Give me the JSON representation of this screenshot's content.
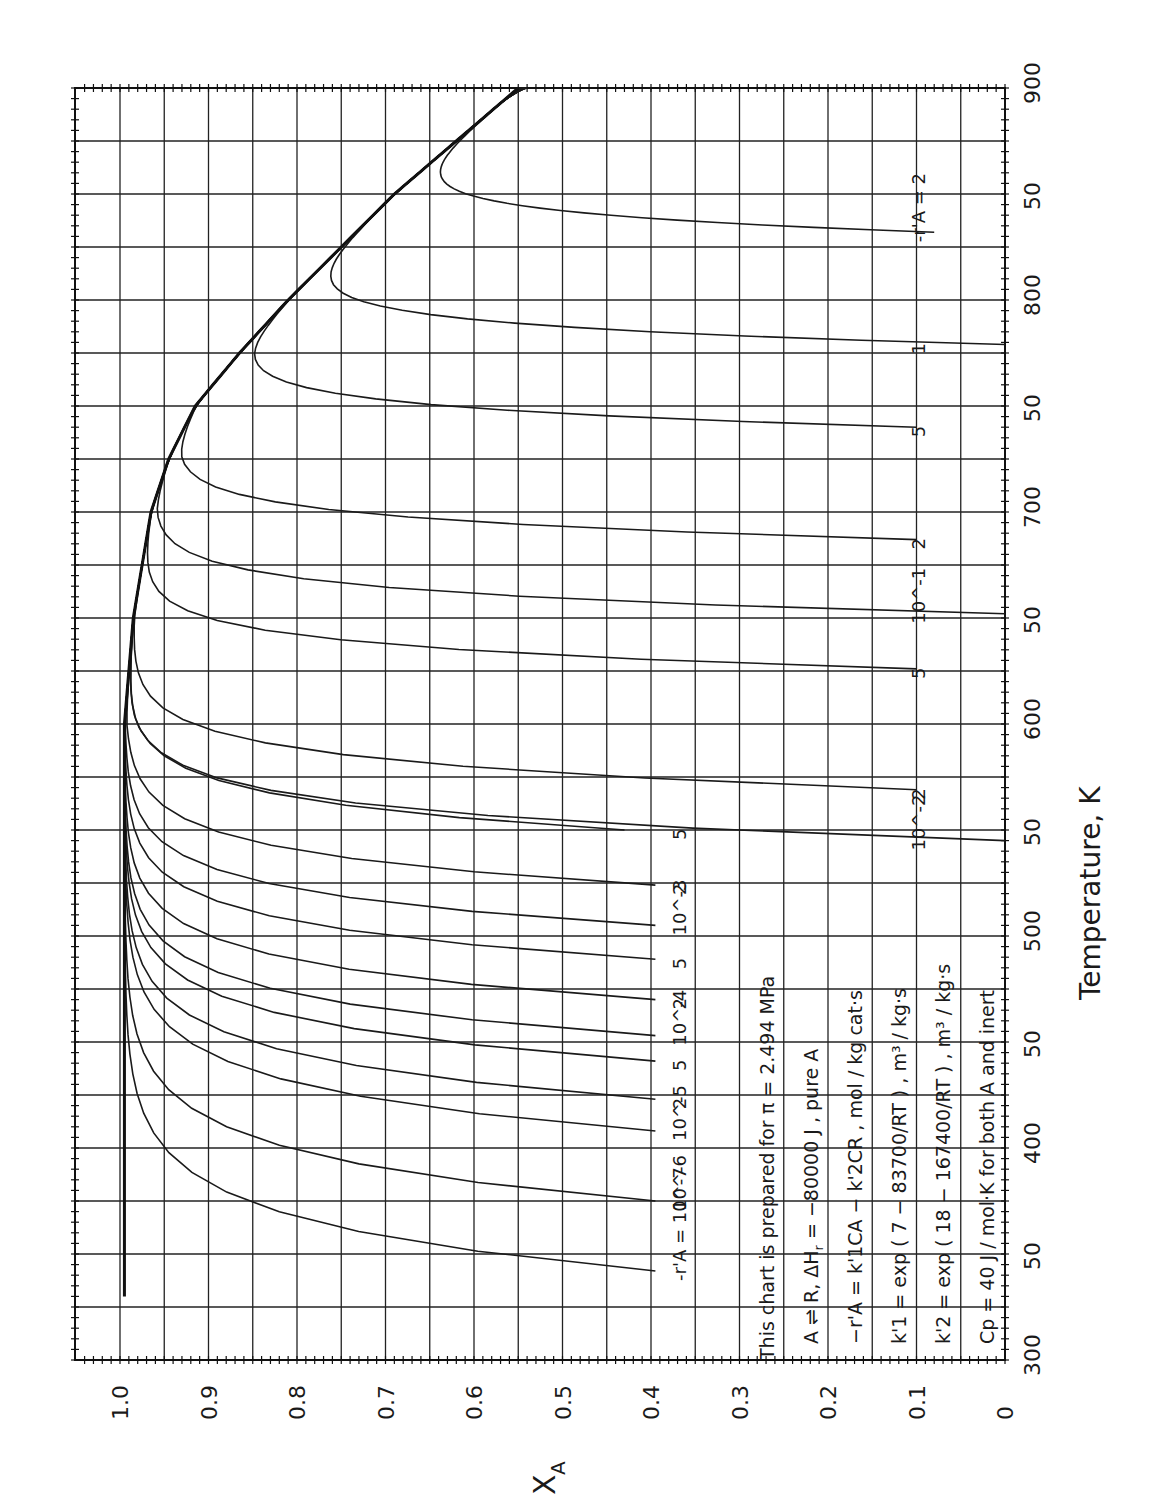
{
  "chart_data": {
    "type": "line",
    "orientation": "rotated-90-ccw",
    "title": "",
    "xlabel": "Temperature, K",
    "ylabel": "X_A",
    "xlim": [
      300,
      900
    ],
    "ylim": [
      0,
      1.05
    ],
    "x_ticks": [
      300,
      350,
      400,
      450,
      500,
      550,
      600,
      650,
      700,
      750,
      800,
      850,
      900
    ],
    "x_tick_labels": [
      "300",
      "50",
      "400",
      "50",
      "500",
      "50",
      "600",
      "50",
      "700",
      "50",
      "800",
      "50",
      "900"
    ],
    "y_ticks": [
      0,
      0.1,
      0.2,
      0.3,
      0.4,
      0.5,
      0.6,
      0.7,
      0.8,
      0.9,
      1.0
    ],
    "y_tick_labels": [
      "0",
      "0.1",
      "0.2",
      "0.3",
      "0.4",
      "0.5",
      "0.6",
      "0.7",
      "0.8",
      "0.9",
      "1.0"
    ],
    "grid": {
      "x_step": 25,
      "y_step": 0.05,
      "on": true
    },
    "equilibrium_envelope": {
      "x": [
        300,
        400,
        500,
        600,
        650,
        700,
        725,
        750,
        775,
        800,
        825,
        850,
        875,
        900
      ],
      "y": [
        1.0,
        1.0,
        1.0,
        0.995,
        0.985,
        0.965,
        0.945,
        0.915,
        0.865,
        0.81,
        0.75,
        0.69,
        0.62,
        0.55
      ]
    },
    "series": [
      {
        "name": "1e-7",
        "label": "-r'A = 10^-7",
        "Tstart": 342,
        "Xend": 0.395
      },
      {
        "name": "1e-6",
        "label": "10^-6",
        "Tstart": 375,
        "Xend": 0.395
      },
      {
        "name": "1e-5",
        "label": "10^-5",
        "Tstart": 408,
        "Xend": 0.395
      },
      {
        "name": "2e-5",
        "label": "2",
        "Tstart": 423,
        "Xend": 0.395
      },
      {
        "name": "5e-5",
        "label": "5",
        "Tstart": 441,
        "Xend": 0.395
      },
      {
        "name": "1e-4",
        "label": "10^-4",
        "Tstart": 453,
        "Xend": 0.395
      },
      {
        "name": "2e-4",
        "label": "2",
        "Tstart": 470,
        "Xend": 0.395
      },
      {
        "name": "5e-4",
        "label": "5",
        "Tstart": 489,
        "Xend": 0.395
      },
      {
        "name": "1e-3",
        "label": "10^-3",
        "Tstart": 505,
        "Xend": 0.395
      },
      {
        "name": "2e-3",
        "label": "2",
        "Tstart": 524,
        "Xend": 0.395
      },
      {
        "name": "5e-3",
        "label": "5",
        "Tstart": 550,
        "Xend": 0.43
      },
      {
        "name": "1e-2",
        "label": "10^-2",
        "Tstart": 545,
        "Xend": 0.0
      },
      {
        "name": "2e-2",
        "label": "2",
        "Tstart": 569,
        "Xend": 0.1
      },
      {
        "name": "5e-2",
        "label": "5",
        "Tstart": 626,
        "Xend": 0.1
      },
      {
        "name": "1e-1",
        "label": "10^-1",
        "Tstart": 652,
        "Xend": 0.0
      },
      {
        "name": "0.2",
        "label": "2",
        "Tstart": 687,
        "Xend": 0.1
      },
      {
        "name": "0.5",
        "label": "5",
        "Tstart": 740,
        "Xend": 0.1
      },
      {
        "name": "1",
        "label": "1",
        "Tstart": 779,
        "Xend": 0.0
      },
      {
        "name": "2",
        "label": "-r'A = 2",
        "Tstart": 832,
        "Xend": 0.08
      }
    ],
    "annotations": [
      "This chart is prepared for π = 2.494 MPa",
      "A ⇌ R,  ΔHr = −80000 J,  pure A",
      "−r'A = k'1 CA − k'2 CR ,  mol / kg cat·s",
      "k'1 = exp(7 − 83700/RT) ,  m³/kg·s",
      "k'2 = exp(18 − 167400/RT) ,  m³/kg·s",
      "Cp = 40 J/mol·K  for both A and inert"
    ]
  },
  "axis": {
    "temperature_title": "Temperature,   K",
    "xa_title": "X",
    "xa_sub": "A"
  },
  "notes": {
    "line1": "This chart is prepared for  π = 2.494 MPa",
    "line2": "A ⇌ R,   ΔH",
    "line2_sub": "r",
    "line2_rest": " = −80000 J ,   pure A",
    "line3": "−r'A = k'1CA − k'2CR ,  mol / kg cat·s",
    "line4": "k'1 = exp ( 7 − 83700/RT ) ,  m³ / kg·s",
    "line5": "k'2 = exp ( 18 − 167400/RT ) ,  m³ / kg·s",
    "line6": "Cp = 40 J / mol·K   for both A and inert"
  }
}
